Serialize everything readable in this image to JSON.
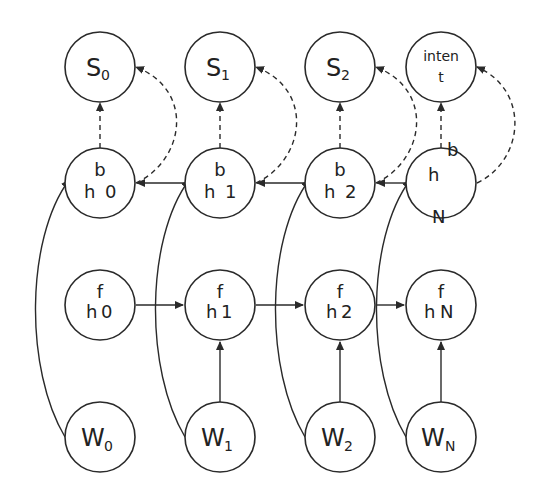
{
  "diagram": {
    "type": "bidirectional-rnn",
    "output_nodes": [
      {
        "id": "S0",
        "main": "S",
        "sub": "0"
      },
      {
        "id": "S1",
        "main": "S",
        "sub": "1"
      },
      {
        "id": "S2",
        "main": "S",
        "sub": "2"
      },
      {
        "id": "intent",
        "line1": "inten",
        "line2": "t"
      }
    ],
    "backward_nodes": [
      {
        "id": "hb0",
        "sup": "b",
        "main": "h",
        "idx": "0"
      },
      {
        "id": "hb1",
        "sup": "b",
        "main": "h",
        "idx": "1"
      },
      {
        "id": "hb2",
        "sup": "b",
        "main": "h",
        "idx": "2"
      },
      {
        "id": "hbN",
        "sup": "b",
        "main": "h",
        "idx": "N"
      }
    ],
    "forward_nodes": [
      {
        "id": "hf0",
        "sup": "f",
        "main": "h",
        "idx": "0"
      },
      {
        "id": "hf1",
        "sup": "f",
        "main": "h",
        "idx": "1"
      },
      {
        "id": "hf2",
        "sup": "f",
        "main": "h",
        "idx": "2"
      },
      {
        "id": "hfN",
        "sup": "f",
        "main": "h",
        "idx": "N"
      }
    ],
    "input_nodes": [
      {
        "id": "W0",
        "main": "W",
        "sub": "0"
      },
      {
        "id": "W1",
        "main": "W",
        "sub": "1"
      },
      {
        "id": "W2",
        "main": "W",
        "sub": "2"
      },
      {
        "id": "WN",
        "main": "W",
        "sub": "N"
      }
    ],
    "edges": [
      {
        "from": "hb0",
        "to": "S0",
        "style": "dashed"
      },
      {
        "from": "hb1",
        "to": "S1",
        "style": "dashed"
      },
      {
        "from": "hb2",
        "to": "S2",
        "style": "dashed"
      },
      {
        "from": "hbN",
        "to": "intent",
        "style": "dashed"
      },
      {
        "from": "hf0",
        "to": "S0",
        "style": "dashed-curve"
      },
      {
        "from": "hf1",
        "to": "S1",
        "style": "dashed-curve"
      },
      {
        "from": "hf2",
        "to": "S2",
        "style": "dashed-curve"
      },
      {
        "from": "hfN",
        "to": "intent",
        "style": "dashed-curve"
      },
      {
        "from": "hb1",
        "to": "hb0",
        "style": "solid"
      },
      {
        "from": "hb2",
        "to": "hb1",
        "style": "solid"
      },
      {
        "from": "hbN",
        "to": "hb2",
        "style": "solid"
      },
      {
        "from": "hf0",
        "to": "hf1",
        "style": "solid"
      },
      {
        "from": "hf1",
        "to": "hf2",
        "style": "solid"
      },
      {
        "from": "hf2",
        "to": "hfN",
        "style": "solid"
      },
      {
        "from": "W1",
        "to": "hf1",
        "style": "solid"
      },
      {
        "from": "W2",
        "to": "hf2",
        "style": "solid"
      },
      {
        "from": "WN",
        "to": "hfN",
        "style": "solid"
      },
      {
        "from": "W0",
        "to": "hb0",
        "style": "solid-curve"
      },
      {
        "from": "W1",
        "to": "hb1",
        "style": "solid-curve"
      },
      {
        "from": "W2",
        "to": "hb2",
        "style": "solid-curve"
      },
      {
        "from": "WN",
        "to": "hbN",
        "style": "solid-curve"
      }
    ]
  }
}
